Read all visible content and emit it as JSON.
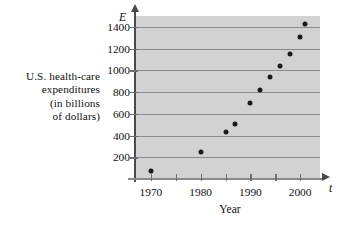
{
  "chart_data": {
    "type": "scatter",
    "title": "",
    "xlabel": "Year",
    "ylabel": "U.S. health-care expenditures (in billions of dollars)",
    "ylabel_lines": [
      "U.S. health-care",
      "expenditures",
      "(in billions",
      "of dollars)"
    ],
    "x_axis_name": "t",
    "y_axis_name": "E",
    "xlim": [
      1967,
      2004
    ],
    "ylim": [
      0,
      1500
    ],
    "xticks": [
      1970,
      1975,
      1980,
      1985,
      1990,
      1995,
      2000
    ],
    "xtick_labels": [
      "1970",
      "",
      "1980",
      "",
      "1990",
      "",
      "2000"
    ],
    "yticks": [
      200,
      400,
      600,
      800,
      1000,
      1200,
      1400
    ],
    "ytick_labels": [
      "200",
      "400",
      "600",
      "800",
      "1000",
      "1200",
      "1400"
    ],
    "grid": "horizontal",
    "legend": "none",
    "plot_background": "#d2d2d2",
    "gridline_color": "#8a8a8a",
    "marker_color": "#1a1a1a",
    "x": [
      1970,
      1980,
      1985,
      1987,
      1990,
      1992,
      1994,
      1996,
      1998,
      2000,
      2001
    ],
    "y": [
      75,
      245,
      435,
      505,
      695,
      820,
      940,
      1040,
      1150,
      1310,
      1425
    ],
    "points": [
      {
        "x": 1970,
        "y": 75
      },
      {
        "x": 1980,
        "y": 245
      },
      {
        "x": 1985,
        "y": 435
      },
      {
        "x": 1987,
        "y": 505
      },
      {
        "x": 1990,
        "y": 695
      },
      {
        "x": 1992,
        "y": 820
      },
      {
        "x": 1994,
        "y": 940
      },
      {
        "x": 1996,
        "y": 1040
      },
      {
        "x": 1998,
        "y": 1150
      },
      {
        "x": 2000,
        "y": 1310
      },
      {
        "x": 2001,
        "y": 1425
      }
    ]
  }
}
